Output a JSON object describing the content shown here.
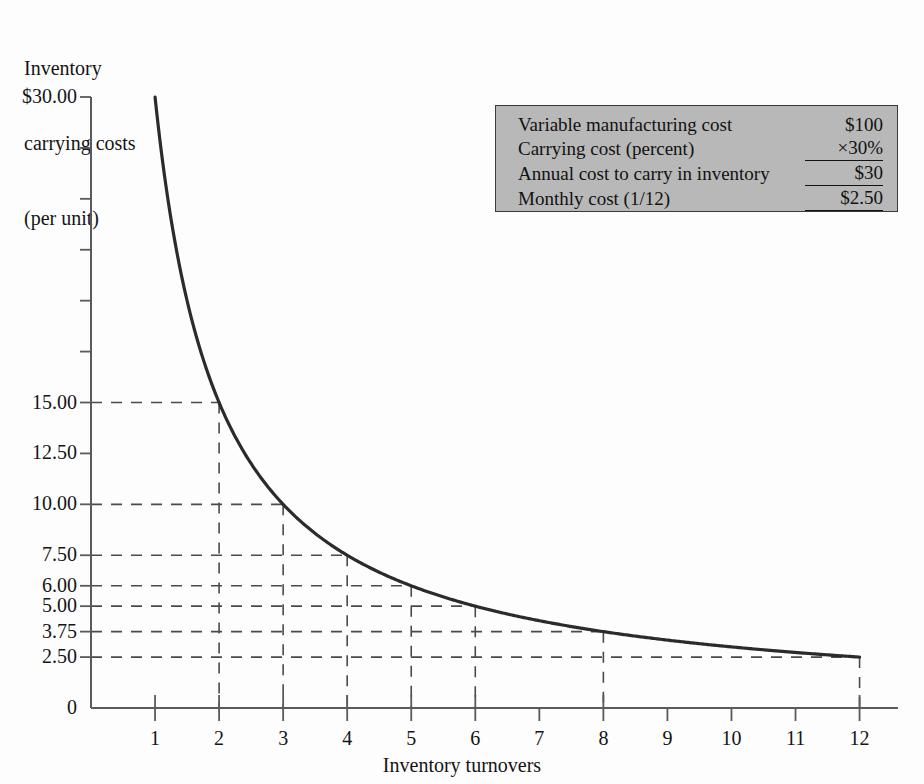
{
  "figure": {
    "y_axis_title_lines": [
      "Inventory",
      "carrying costs",
      "(per unit)"
    ],
    "x_axis_title": "Inventory turnovers"
  },
  "info_box": {
    "name": "carrying-cost-calculation",
    "background_color": "#b8b8b8",
    "rows": [
      {
        "label": "Variable manufacturing cost",
        "value": "$100",
        "rule_below": false
      },
      {
        "label": "Carrying cost (percent)",
        "value": "×30%",
        "rule_below": true
      },
      {
        "label": "Annual cost to carry in inventory",
        "value": "$30",
        "rule_below": true
      },
      {
        "label": "Monthly cost (1/12)",
        "value": "$2.50",
        "rule_below": true
      }
    ]
  },
  "chart_data": {
    "type": "line",
    "title": "",
    "xlabel": "Inventory turnovers",
    "ylabel": "Inventory carrying costs (per unit)",
    "xlim": [
      0,
      12.6
    ],
    "ylim": [
      0,
      30
    ],
    "grid": "dashed-guide-lines",
    "legend": "none",
    "curve_formula": "y = 30 / x",
    "x": [
      1,
      2,
      3,
      4,
      5,
      6,
      8,
      12
    ],
    "values": [
      30.0,
      15.0,
      10.0,
      7.5,
      6.0,
      5.0,
      3.75,
      2.5
    ],
    "series": [
      {
        "name": "Inventory carrying cost per unit",
        "points": [
          {
            "x": 1,
            "y": 30.0
          },
          {
            "x": 2,
            "y": 15.0
          },
          {
            "x": 3,
            "y": 10.0
          },
          {
            "x": 4,
            "y": 7.5
          },
          {
            "x": 5,
            "y": 6.0
          },
          {
            "x": 6,
            "y": 5.0
          },
          {
            "x": 8,
            "y": 3.75
          },
          {
            "x": 12,
            "y": 2.5
          }
        ],
        "color": "#2b2b2b"
      }
    ],
    "yticks": [
      {
        "value": 30.0,
        "label": "$30.00",
        "major": true,
        "guide": false
      },
      {
        "value": 27.5,
        "label": "",
        "major": false,
        "guide": false
      },
      {
        "value": 25.0,
        "label": "",
        "major": false,
        "guide": false
      },
      {
        "value": 22.5,
        "label": "",
        "major": false,
        "guide": false
      },
      {
        "value": 20.0,
        "label": "",
        "major": false,
        "guide": false
      },
      {
        "value": 17.5,
        "label": "",
        "major": false,
        "guide": false
      },
      {
        "value": 15.0,
        "label": "15.00",
        "major": true,
        "guide": true
      },
      {
        "value": 12.5,
        "label": "12.50",
        "major": true,
        "guide": false
      },
      {
        "value": 10.0,
        "label": "10.00",
        "major": true,
        "guide": true
      },
      {
        "value": 7.5,
        "label": "7.50",
        "major": true,
        "guide": true
      },
      {
        "value": 6.0,
        "label": "6.00",
        "major": true,
        "guide": true
      },
      {
        "value": 5.0,
        "label": "5.00",
        "major": true,
        "guide": true
      },
      {
        "value": 3.75,
        "label": "3.75",
        "major": true,
        "guide": true
      },
      {
        "value": 2.5,
        "label": "2.50",
        "major": true,
        "guide": true
      },
      {
        "value": 0,
        "label": "0",
        "major": true,
        "guide": false
      }
    ],
    "xticks": [
      {
        "value": 1,
        "label": "1"
      },
      {
        "value": 2,
        "label": "2"
      },
      {
        "value": 3,
        "label": "3"
      },
      {
        "value": 4,
        "label": "4"
      },
      {
        "value": 5,
        "label": "5"
      },
      {
        "value": 6,
        "label": "6"
      },
      {
        "value": 7,
        "label": "7"
      },
      {
        "value": 8,
        "label": "8"
      },
      {
        "value": 9,
        "label": "9"
      },
      {
        "value": 10,
        "label": "10"
      },
      {
        "value": 11,
        "label": "11"
      },
      {
        "value": 12,
        "label": "12"
      }
    ],
    "guide_points": [
      {
        "x": 2,
        "y": 15.0
      },
      {
        "x": 3,
        "y": 10.0
      },
      {
        "x": 4,
        "y": 7.5
      },
      {
        "x": 5,
        "y": 6.0
      },
      {
        "x": 6,
        "y": 5.0
      },
      {
        "x": 8,
        "y": 3.75
      },
      {
        "x": 12,
        "y": 2.5
      }
    ]
  }
}
